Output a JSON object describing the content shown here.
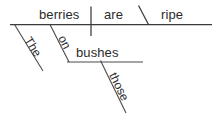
{
  "diagram": {
    "type": "reed-kellogg-sentence-diagram",
    "sentence": "The berries on those bushes are ripe.",
    "ink_color": "#3a3a3a",
    "text_color": "#2b2b2b",
    "background_color": "#ffffff",
    "words": {
      "subject": "berries",
      "verb": "are",
      "subject_complement": "ripe",
      "subject_article": "The",
      "preposition": "on",
      "prep_object": "bushes",
      "prep_object_determiner": "those"
    },
    "labels": {
      "baseline": "main-baseline",
      "subject_verb_divider": "subject-verb-divider",
      "complement_slant": "predicate-adjective-slant",
      "article_slant": "article-modifier-line",
      "prep_slant": "preposition-slant-line",
      "prep_baseline": "prepositional-object-baseline",
      "determiner_slant": "determiner-modifier-line"
    }
  }
}
